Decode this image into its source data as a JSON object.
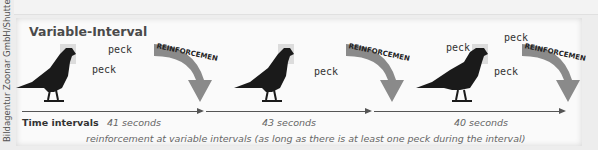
{
  "credit": "Bildagentur Zoonar GmbH/Shutterstock",
  "title": "Variable-Interval",
  "axis_label": "Time intervals",
  "reinforcement_label": "REINFORCEMENT",
  "peck_label": "peck",
  "intervals": [
    {
      "label": "41 seconds",
      "pecks": 2
    },
    {
      "label": "43 seconds",
      "pecks": 1
    },
    {
      "label": "40 seconds",
      "pecks": 3
    }
  ],
  "caption": "reinforcement at variable intervals (as long as there is at least one peck during the interval)",
  "colors": {
    "bird": "#1a1a1a",
    "arrow": "#8a8a8a",
    "arrow_tip": "#9a9a6a",
    "axis": "#555555"
  }
}
